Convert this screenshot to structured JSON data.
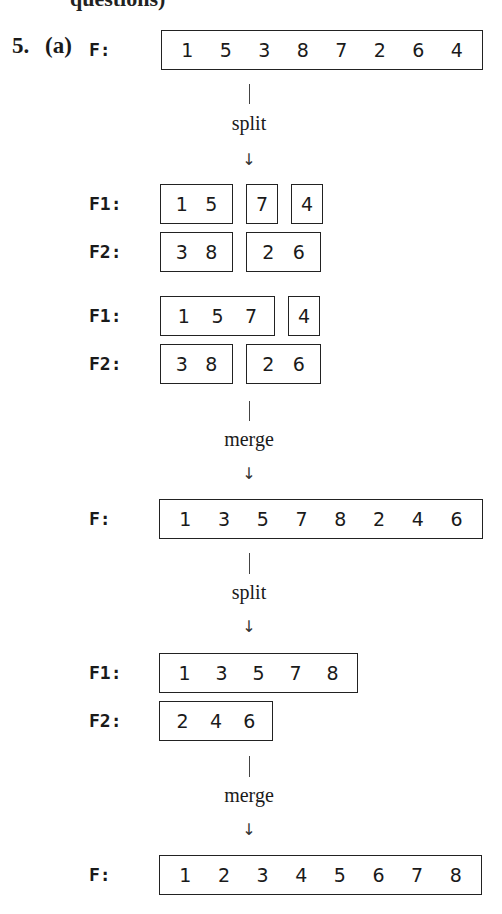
{
  "header": {
    "cutoff_text": "questions)",
    "question_number": "5.",
    "part": "(a)"
  },
  "labels": {
    "F": "F:",
    "F1": "F1:",
    "F2": "F2:"
  },
  "operations": {
    "split": "split",
    "merge": "merge",
    "arrow": "↓"
  },
  "steps": [
    {
      "name": "initial",
      "F": [
        [
          "1",
          "5",
          "3",
          "8",
          "7",
          "2",
          "6",
          "4"
        ]
      ]
    },
    {
      "name": "split-1",
      "F1": [
        [
          "1",
          "5"
        ],
        [
          "7"
        ],
        [
          "4"
        ]
      ],
      "F2": [
        [
          "3",
          "8"
        ],
        [
          "2",
          "6"
        ]
      ]
    },
    {
      "name": "merge-runs-1",
      "F1": [
        [
          "1",
          "5",
          "7"
        ],
        [
          "4"
        ]
      ],
      "F2": [
        [
          "3",
          "8"
        ],
        [
          "2",
          "6"
        ]
      ]
    },
    {
      "name": "after-merge-1",
      "F": [
        [
          "1",
          "3",
          "5",
          "7",
          "8",
          "2",
          "4",
          "6"
        ]
      ]
    },
    {
      "name": "split-2",
      "F1": [
        [
          "1",
          "3",
          "5",
          "7",
          "8"
        ]
      ],
      "F2": [
        [
          "2",
          "4",
          "6"
        ]
      ]
    },
    {
      "name": "final",
      "F": [
        [
          "1",
          "2",
          "3",
          "4",
          "5",
          "6",
          "7",
          "8"
        ]
      ]
    }
  ]
}
